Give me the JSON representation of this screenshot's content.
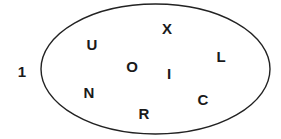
{
  "diagram": {
    "type": "set-ellipse",
    "ellipse": {
      "cx": 155.5,
      "cy": 69,
      "rx": 114.5,
      "ry": 65,
      "stroke": "#222222"
    },
    "outside_elements": [
      {
        "label": "1",
        "x": 22,
        "y": 71
      }
    ],
    "inside_elements": [
      {
        "label": "U",
        "x": 92,
        "y": 44
      },
      {
        "label": "X",
        "x": 167,
        "y": 28
      },
      {
        "label": "L",
        "x": 221,
        "y": 56
      },
      {
        "label": "O",
        "x": 132,
        "y": 66
      },
      {
        "label": "I",
        "x": 169,
        "y": 73
      },
      {
        "label": "N",
        "x": 89,
        "y": 92
      },
      {
        "label": "C",
        "x": 203,
        "y": 99
      },
      {
        "label": "R",
        "x": 144,
        "y": 113
      }
    ]
  }
}
